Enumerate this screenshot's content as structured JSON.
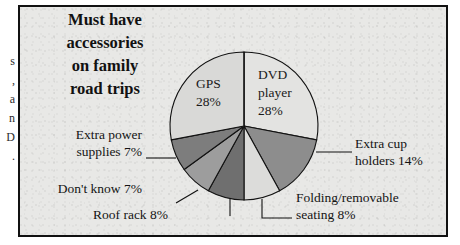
{
  "figure": {
    "title_lines": [
      "Must have",
      "accessories",
      "on family",
      "road trips"
    ],
    "frame_color": "#111111",
    "background_color": "#e8e8e6"
  },
  "bleed_text": {
    "note": "partial letters from adjacent newspaper column",
    "chars": [
      "s",
      ",",
      "a",
      "n",
      "D",
      "."
    ]
  },
  "chart_data": {
    "type": "pie",
    "title": "Must have accessories on family road trips",
    "xlabel": "",
    "ylabel": "",
    "units": "percent",
    "total": 100,
    "categories": [
      "DVD player",
      "Extra cup holders",
      "Folding/removable seating",
      "Roof rack",
      "Don't know",
      "Extra power supplies",
      "GPS"
    ],
    "values": [
      28,
      14,
      8,
      8,
      7,
      7,
      28
    ],
    "slice_colors": [
      "#e3e3e1",
      "#8d8d8d",
      "#dcdcda",
      "#6f6f6f",
      "#9d9d9d",
      "#7d7d7d",
      "#d9d9d7"
    ],
    "start_angle_deg": 0,
    "direction": "clockwise",
    "legend": "none",
    "grid": false,
    "slices": [
      {
        "label": "DVD player",
        "value": 28,
        "label_lines": [
          "DVD",
          "player",
          "28%"
        ],
        "label_placement": "inside"
      },
      {
        "label": "Extra cup holders",
        "value": 14,
        "label_lines": [
          "Extra cup",
          "holders 14%"
        ],
        "label_placement": "outside-right"
      },
      {
        "label": "Folding/removable seating",
        "value": 8,
        "label_lines": [
          "Folding/removable",
          "seating 8%"
        ],
        "label_placement": "outside-right"
      },
      {
        "label": "Roof rack",
        "value": 8,
        "label_lines": [
          "Roof rack 8%"
        ],
        "label_placement": "outside-left"
      },
      {
        "label": "Don't know",
        "value": 7,
        "label_lines": [
          "Don't know 7%"
        ],
        "label_placement": "outside-left"
      },
      {
        "label": "Extra power supplies",
        "value": 7,
        "label_lines": [
          "Extra power",
          "supplies 7%"
        ],
        "label_placement": "outside-left"
      },
      {
        "label": "GPS",
        "value": 28,
        "label_lines": [
          "GPS",
          "28%"
        ],
        "label_placement": "inside"
      }
    ]
  },
  "labels": {
    "gps_l1": "GPS",
    "gps_l2": "28%",
    "dvd_l1": "DVD",
    "dvd_l2": "player",
    "dvd_l3": "28%",
    "cup_l1": "Extra cup",
    "cup_l2": "holders 14%",
    "seating_l1": "Folding/removable",
    "seating_l2": "seating 8%",
    "roofrack": "Roof rack 8%",
    "dontknow": "Don't know 7%",
    "power_l1": "Extra power",
    "power_l2": "supplies 7%"
  }
}
